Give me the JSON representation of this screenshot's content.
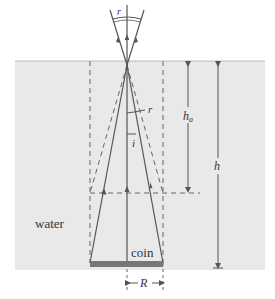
{
  "diagram": {
    "labels": {
      "water": "water",
      "coin": "coin",
      "r_top": "r",
      "r_mid": "r",
      "i": "i",
      "h_a": "h",
      "h_a_sub": "a",
      "h": "h",
      "R": "R"
    },
    "colors": {
      "water": "#e9e9e9",
      "line": "#555555",
      "coin": "#777777",
      "background": "#ffffff"
    }
  }
}
